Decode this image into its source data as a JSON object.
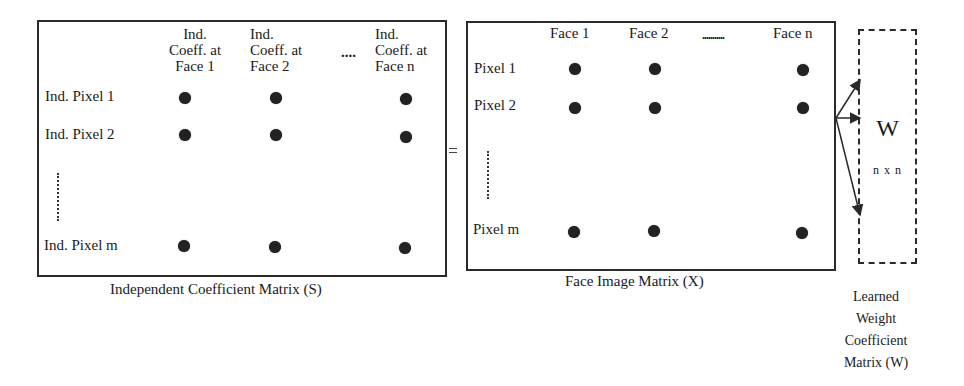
{
  "diagram": {
    "left_matrix": {
      "caption": "Independent Coefficient Matrix (S)",
      "column_headers": [
        {
          "line1": "Ind.",
          "line2": "Coeff. at",
          "line3": "Face 1"
        },
        {
          "line1": "Ind.",
          "line2": "Coeff. at",
          "line3": "Face 2"
        },
        {
          "line1": "Ind.",
          "line2": "Coeff. at",
          "line3": "Face n"
        }
      ],
      "column_ellipsis": "....",
      "row_labels": [
        "Ind. Pixel 1",
        "Ind. Pixel 2",
        "Ind. Pixel m"
      ]
    },
    "equals_sign": "=",
    "right_matrix": {
      "caption": "Face Image Matrix (X)",
      "column_headers": [
        "Face 1",
        "Face 2",
        "Face n"
      ],
      "column_ellipsis": "...........",
      "row_labels": [
        "Pixel 1",
        "Pixel 2",
        "Pixel m"
      ]
    },
    "weight_matrix": {
      "symbol": "W",
      "dimension": "n x n",
      "caption_lines": [
        "Learned",
        "Weight",
        "Coefficient",
        "Matrix (W)"
      ]
    },
    "colors": {
      "line": "#2a2a2a",
      "dot": "#222222",
      "background": "#ffffff"
    }
  }
}
